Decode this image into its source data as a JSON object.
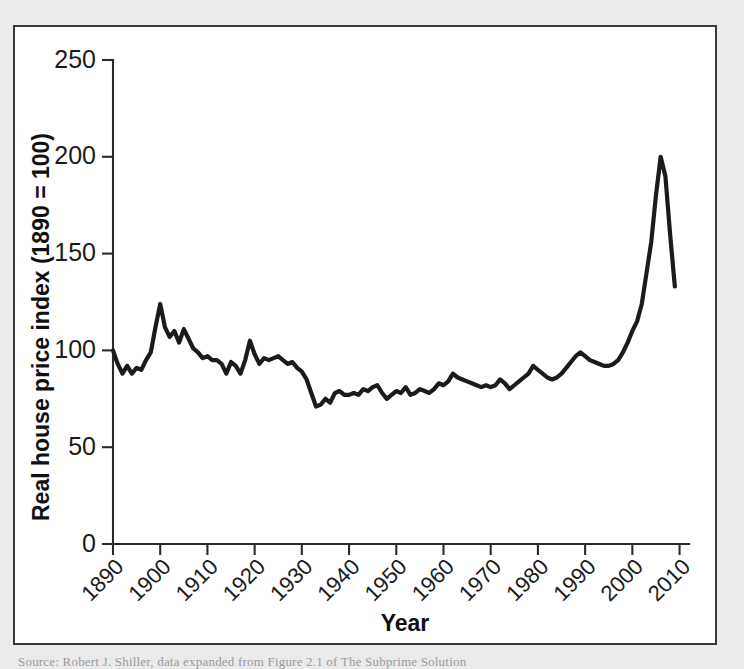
{
  "figure": {
    "background_color": "#ebebec",
    "panel_color": "#ffffff",
    "border_color": "#3a3a3a",
    "line_color": "#1b1b1b"
  },
  "caption": {
    "text": "Source: Robert J. Shiller, data expanded from Figure 2.1 of The Subprime Solution"
  },
  "chart_data": {
    "type": "line",
    "title": "",
    "xlabel": "Year",
    "ylabel": "Real house price index (1890 = 100)",
    "xlim": [
      1890,
      2012
    ],
    "ylim": [
      0,
      250
    ],
    "grid": false,
    "legend": null,
    "xticks": [
      1890,
      1900,
      1910,
      1920,
      1930,
      1940,
      1950,
      1960,
      1970,
      1980,
      1990,
      2000,
      2010
    ],
    "xtick_labels": [
      "1890",
      "1900",
      "1910",
      "1920",
      "1930",
      "1940",
      "1950",
      "1960",
      "1970",
      "1980",
      "1990",
      "2000",
      "2010"
    ],
    "xtick_rotation": 45,
    "yticks": [
      0,
      50,
      100,
      150,
      200,
      250
    ],
    "ytick_labels": [
      "0",
      "50",
      "100",
      "150",
      "200",
      "250"
    ],
    "series": [
      {
        "name": "Real house price index",
        "x": [
          1890,
          1891,
          1892,
          1893,
          1894,
          1895,
          1896,
          1897,
          1898,
          1899,
          1900,
          1901,
          1902,
          1903,
          1904,
          1905,
          1906,
          1907,
          1908,
          1909,
          1910,
          1911,
          1912,
          1913,
          1914,
          1915,
          1916,
          1917,
          1918,
          1919,
          1920,
          1921,
          1922,
          1923,
          1924,
          1925,
          1926,
          1927,
          1928,
          1929,
          1930,
          1931,
          1932,
          1933,
          1934,
          1935,
          1936,
          1937,
          1938,
          1939,
          1940,
          1941,
          1942,
          1943,
          1944,
          1945,
          1946,
          1947,
          1948,
          1949,
          1950,
          1951,
          1952,
          1953,
          1954,
          1955,
          1956,
          1957,
          1958,
          1959,
          1960,
          1961,
          1962,
          1963,
          1964,
          1965,
          1966,
          1967,
          1968,
          1969,
          1970,
          1971,
          1972,
          1973,
          1974,
          1975,
          1976,
          1977,
          1978,
          1979,
          1980,
          1981,
          1982,
          1983,
          1984,
          1985,
          1986,
          1987,
          1988,
          1989,
          1990,
          1991,
          1992,
          1993,
          1994,
          1995,
          1996,
          1997,
          1998,
          1999,
          2000,
          2001,
          2002,
          2003,
          2004,
          2005,
          2006,
          2007,
          2008,
          2009
        ],
        "y": [
          100,
          93,
          88,
          92,
          88,
          91,
          90,
          95,
          99,
          112,
          124,
          112,
          107,
          110,
          104,
          111,
          106,
          101,
          99,
          96,
          97,
          95,
          95,
          93,
          88,
          94,
          92,
          88,
          95,
          105,
          98,
          93,
          96,
          95,
          96,
          97,
          95,
          93,
          94,
          91,
          89,
          85,
          78,
          71,
          72,
          75,
          73,
          78,
          79,
          77,
          77,
          78,
          77,
          80,
          79,
          81,
          82,
          78,
          75,
          77,
          79,
          78,
          81,
          77,
          78,
          80,
          79,
          78,
          80,
          83,
          82,
          84,
          88,
          86,
          85,
          84,
          83,
          82,
          81,
          82,
          81,
          82,
          85,
          83,
          80,
          82,
          84,
          86,
          88,
          92,
          90,
          88,
          86,
          85,
          86,
          88,
          91,
          94,
          97,
          99,
          97,
          95,
          94,
          93,
          92,
          92,
          93,
          95,
          99,
          104,
          110,
          115,
          124,
          140,
          156,
          180,
          200,
          190,
          160,
          133
        ]
      }
    ],
    "annotations": {
      "peak_year": 2006,
      "peak_value": 200,
      "baseline_year": 1890,
      "baseline_value": 100,
      "trough_year": 1933,
      "trough_value": 71
    }
  }
}
